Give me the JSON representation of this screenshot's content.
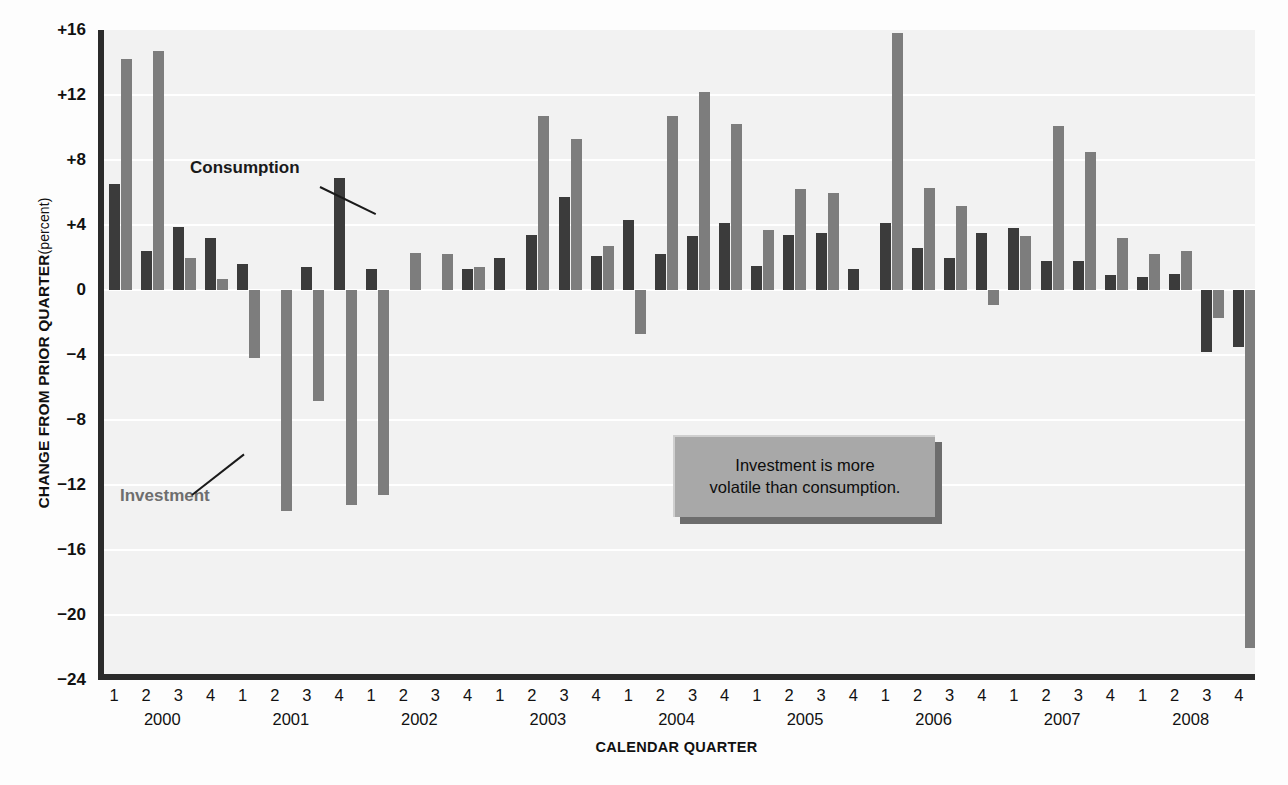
{
  "axes": {
    "y_title_main": "CHANGE FROM PRIOR QUARTER",
    "y_title_sub": "(percent)",
    "x_title": "CALENDAR QUARTER",
    "y_ticks": [
      "+16",
      "+12",
      "+8",
      "+4",
      "0",
      "−4",
      "−8",
      "−12",
      "−16",
      "−20",
      "−24"
    ],
    "y_tick_values": [
      16,
      12,
      8,
      4,
      0,
      -4,
      -8,
      -12,
      -16,
      -20,
      -24
    ]
  },
  "annotations": {
    "consumption_label": "Consumption",
    "investment_label": "Investment",
    "callout_line1": "Investment is more",
    "callout_line2": "volatile than consumption."
  },
  "colors": {
    "consumption": "#3b3b3b",
    "investment": "#7d7d7d",
    "plot_background": "#f2f2f2",
    "gridline": "#ffffff",
    "axis": "#2b2b2b",
    "callout_fill": "#a8a8a8",
    "callout_shadow": "#6d6d6d"
  },
  "chart_data": {
    "type": "bar",
    "title": "",
    "subtitle": "",
    "xlabel": "CALENDAR QUARTER",
    "ylabel": "CHANGE FROM PRIOR QUARTER (percent)",
    "ylim": [
      -24,
      16
    ],
    "ytick_step": 4,
    "grid": true,
    "legend": "inline-annotations",
    "years": [
      "2000",
      "2001",
      "2002",
      "2003",
      "2004",
      "2005",
      "2006",
      "2007",
      "2008"
    ],
    "quarters": [
      "1",
      "2",
      "3",
      "4"
    ],
    "categories": [
      "2000 Q1",
      "2000 Q2",
      "2000 Q3",
      "2000 Q4",
      "2001 Q1",
      "2001 Q2",
      "2001 Q3",
      "2001 Q4",
      "2002 Q1",
      "2002 Q2",
      "2002 Q3",
      "2002 Q4",
      "2003 Q1",
      "2003 Q2",
      "2003 Q3",
      "2003 Q4",
      "2004 Q1",
      "2004 Q2",
      "2004 Q3",
      "2004 Q4",
      "2005 Q1",
      "2005 Q2",
      "2005 Q3",
      "2005 Q4",
      "2006 Q1",
      "2006 Q2",
      "2006 Q3",
      "2006 Q4",
      "2007 Q1",
      "2007 Q2",
      "2007 Q3",
      "2007 Q4",
      "2008 Q1",
      "2008 Q2",
      "2008 Q3",
      "2008 Q4"
    ],
    "series": [
      {
        "name": "Consumption",
        "color": "#3b3b3b",
        "values": [
          6.5,
          2.4,
          3.9,
          3.2,
          1.6,
          0.0,
          1.4,
          6.9,
          1.3,
          0.0,
          0.0,
          1.3,
          2.0,
          3.4,
          5.7,
          2.1,
          4.3,
          2.2,
          3.3,
          4.1,
          1.5,
          3.4,
          3.5,
          1.3,
          4.1,
          2.6,
          2.0,
          3.5,
          3.8,
          1.8,
          1.8,
          0.9,
          0.8,
          1.0,
          -3.8,
          -3.5
        ]
      },
      {
        "name": "Investment",
        "color": "#7d7d7d",
        "values": [
          14.2,
          14.7,
          2.0,
          0.7,
          -4.2,
          -13.6,
          -6.8,
          -13.2,
          -12.6,
          2.3,
          2.2,
          1.4,
          0.0,
          10.7,
          9.3,
          2.7,
          -2.7,
          10.7,
          12.2,
          10.2,
          3.7,
          6.2,
          6.0,
          0.0,
          15.8,
          6.3,
          5.2,
          -0.9,
          3.3,
          10.1,
          8.5,
          3.2,
          2.2,
          2.4,
          -1.7,
          -22.0
        ]
      }
    ],
    "notes": [
      "Consumption bars are dark; investment bars are medium gray.",
      "Investment is far more volatile than consumption.",
      "2008 Q4 investment falls to about -22 percent."
    ]
  }
}
